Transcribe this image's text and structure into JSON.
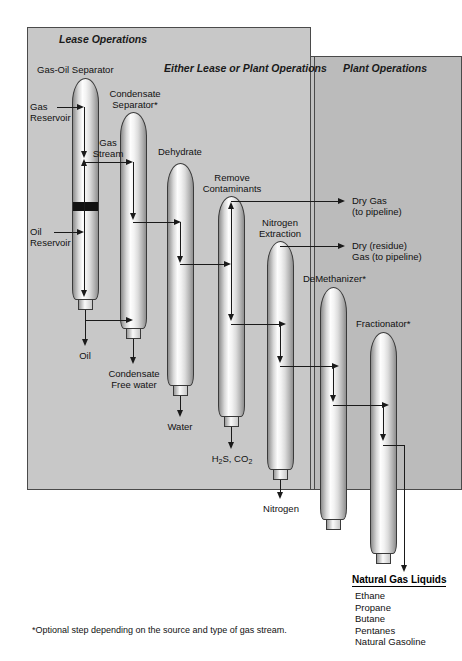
{
  "diagram": {
    "panels": [
      {
        "id": "lease",
        "label": "Lease Operations"
      },
      {
        "id": "either",
        "label": "Either Lease or Plant Operations"
      },
      {
        "id": "plant",
        "label": "Plant Operations"
      }
    ],
    "vessels": [
      {
        "id": "gas-oil-separator",
        "label": "Gas-Oil Separator"
      },
      {
        "id": "condensate-separator",
        "label": "Condensate\nSeparator*"
      },
      {
        "id": "dehydrate",
        "label": "Dehydrate"
      },
      {
        "id": "remove-contaminants",
        "label": "Remove\nContaminants"
      },
      {
        "id": "nitrogen-extraction",
        "label": "Nitrogen\nExtraction"
      },
      {
        "id": "demethanizer",
        "label": "DeMethanizer*"
      },
      {
        "id": "fractionator",
        "label": "Fractionator*"
      }
    ],
    "vessel_labels": {
      "gas_oil_separator": "Gas-Oil Separator",
      "condensate_separator_l1": "Condensate",
      "condensate_separator_l2": "Separator*",
      "dehydrate": "Dehydrate",
      "remove_contaminants_l1": "Remove",
      "remove_contaminants_l2": "Contaminants",
      "nitrogen_extraction_l1": "Nitrogen",
      "nitrogen_extraction_l2": "Extraction",
      "demethanizer": "DeMethanizer*",
      "fractionator": "Fractionator*"
    },
    "inputs": {
      "gas_reservoir_l1": "Gas",
      "gas_reservoir_l2": "Reservoir",
      "oil_reservoir_l1": "Oil",
      "oil_reservoir_l2": "Reservoir"
    },
    "stream_labels": {
      "gas_stream_l1": "Gas",
      "gas_stream_l2": "Stream"
    },
    "outputs": {
      "oil": "Oil",
      "condensate_l1": "Condensate",
      "condensate_l2": "Free water",
      "water": "Water",
      "acid_gas_h": "H",
      "acid_gas_h_sub": "2",
      "acid_gas_s": "S, CO",
      "acid_gas_co2_sub": "2",
      "nitrogen": "Nitrogen",
      "dry_gas_l1": "Dry Gas",
      "dry_gas_l2": "(to pipeline)",
      "residue_gas_l1": "Dry (residue)",
      "residue_gas_l2": "Gas (to pipeline)"
    },
    "ngl": {
      "title": "Natural Gas Liquids",
      "items": [
        "Ethane",
        "Propane",
        "Butane",
        "Pentanes",
        "Natural Gasoline"
      ]
    },
    "footnote": "*Optional step depending on the source and type of gas stream.",
    "colors": {
      "panel_lease": "#c8c8c8",
      "panel_either": "#c2c2c2",
      "panel_plant": "#bbbbbb",
      "line": "#1a1a1a",
      "background": "#ffffff"
    }
  }
}
